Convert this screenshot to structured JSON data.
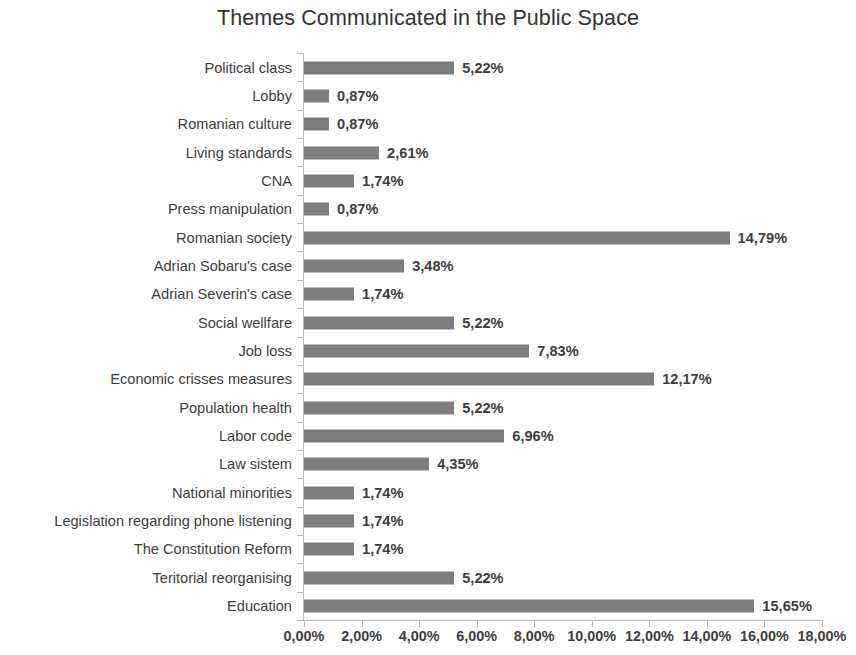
{
  "chart_data": {
    "type": "bar",
    "orientation": "horizontal",
    "title": "Themes Communicated in the Public Space",
    "xlabel": "",
    "ylabel": "",
    "xlim": [
      0,
      18
    ],
    "grid": false,
    "legend": null,
    "bar_color": "#7e7e7e",
    "axis_color": "#b8b8b8",
    "decimal_separator": ",",
    "value_suffix": "%",
    "categories": [
      "Political class",
      "Lobby",
      "Romanian culture",
      "Living standards",
      "CNA",
      "Press manipulation",
      "Romanian society",
      "Adrian Sobaru's case",
      "Adrian Severin's case",
      "Social wellfare",
      "Job loss",
      "Economic crisses measures",
      "Population health",
      "Labor code",
      "Law sistem",
      "National minorities",
      "Legislation regarding phone listening",
      "The Constitution Reform",
      "Teritorial reorganising",
      "Education"
    ],
    "values": [
      5.22,
      0.87,
      0.87,
      2.61,
      1.74,
      0.87,
      14.79,
      3.48,
      1.74,
      5.22,
      7.83,
      12.17,
      5.22,
      6.96,
      4.35,
      1.74,
      1.74,
      1.74,
      5.22,
      15.65
    ],
    "value_labels": [
      "5,22%",
      "0,87%",
      "0,87%",
      "2,61%",
      "1,74%",
      "0,87%",
      "14,79%",
      "3,48%",
      "1,74%",
      "5,22%",
      "7,83%",
      "12,17%",
      "5,22%",
      "6,96%",
      "4,35%",
      "1,74%",
      "1,74%",
      "1,74%",
      "5,22%",
      "15,65%"
    ],
    "xticks": [
      0,
      2,
      4,
      6,
      8,
      10,
      12,
      14,
      16,
      18
    ],
    "xtick_labels": [
      "0,00%",
      "2,00%",
      "4,00%",
      "6,00%",
      "8,00%",
      "10,00%",
      "12,00%",
      "14,00%",
      "16,00%",
      "18,00%"
    ]
  }
}
